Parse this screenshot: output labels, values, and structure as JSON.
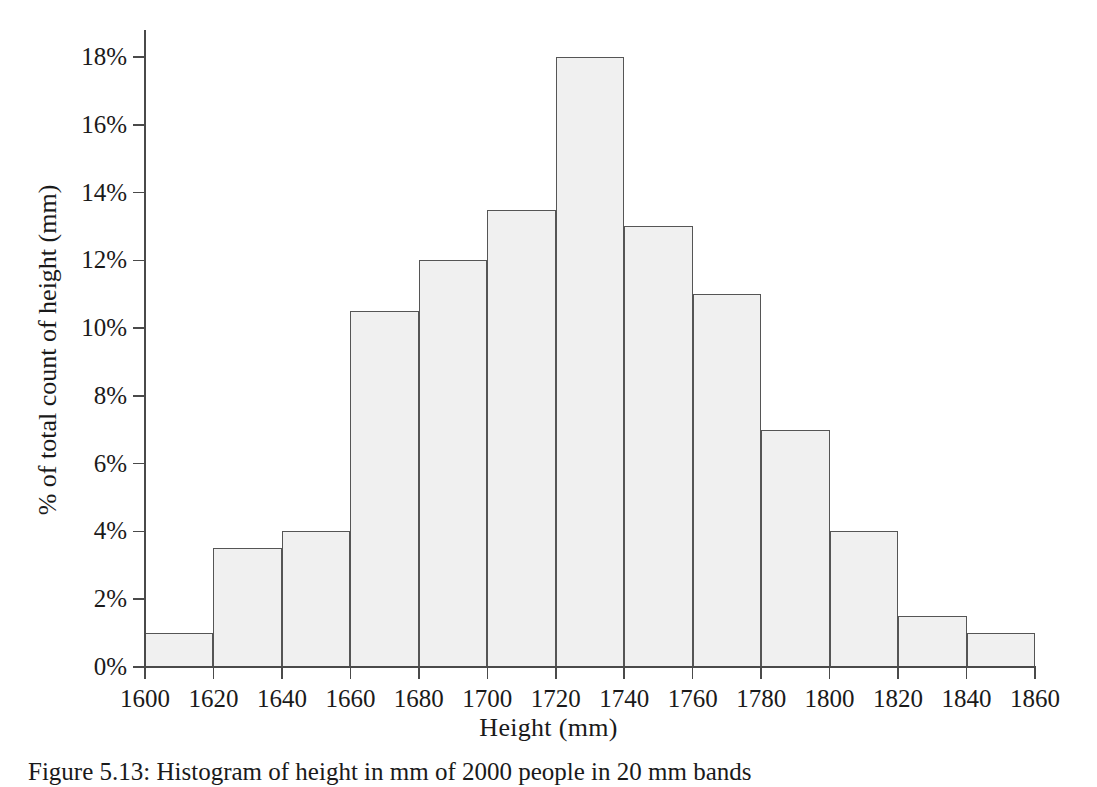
{
  "chart_data": {
    "type": "bar",
    "title": "",
    "xlabel": "Height (mm)",
    "ylabel": "% of total count of height (mm)",
    "xlim": [
      1600,
      1860
    ],
    "ylim": [
      0,
      18
    ],
    "grid": false,
    "legend": null,
    "bin_width": 20,
    "bin_edges": [
      1600,
      1620,
      1640,
      1660,
      1680,
      1700,
      1720,
      1740,
      1760,
      1780,
      1800,
      1820,
      1840,
      1860
    ],
    "categories": [
      "1600-1620",
      "1620-1640",
      "1640-1660",
      "1660-1680",
      "1680-1700",
      "1700-1720",
      "1720-1740",
      "1740-1760",
      "1760-1780",
      "1780-1800",
      "1800-1820",
      "1820-1840",
      "1840-1860"
    ],
    "values": [
      1.0,
      3.5,
      4.0,
      10.5,
      12.0,
      13.5,
      18.0,
      13.0,
      11.0,
      7.0,
      4.0,
      1.5,
      1.0
    ],
    "xticks": [
      1600,
      1620,
      1640,
      1660,
      1680,
      1700,
      1720,
      1740,
      1760,
      1780,
      1800,
      1820,
      1840,
      1860
    ],
    "xtick_labels": [
      "1600",
      "1620",
      "1640",
      "1660",
      "1680",
      "1700",
      "1720",
      "1740",
      "1760",
      "1780",
      "1800",
      "1820",
      "1840",
      "1860"
    ],
    "yticks": [
      0,
      2,
      4,
      6,
      8,
      10,
      12,
      14,
      16,
      18
    ],
    "ytick_labels": [
      "0%",
      "2%",
      "4%",
      "6%",
      "8%",
      "10%",
      "12%",
      "14%",
      "16%",
      "18%"
    ],
    "bar_fill_color": "#f0f0f0",
    "bar_edge_color": "#555555",
    "axis_color": "#4a4a4a"
  },
  "caption": {
    "text": "Figure 5.13: Histogram of height in mm of 2000 people in 20 mm bands"
  }
}
